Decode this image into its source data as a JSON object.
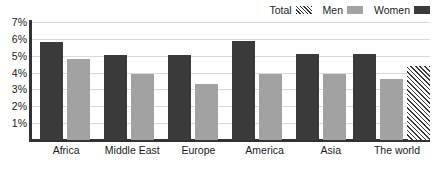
{
  "chart_data": {
    "type": "bar",
    "title": "",
    "subtitle": "",
    "xlabel": "",
    "ylabel": "",
    "ylim": [
      0,
      7
    ],
    "y_ticks": [
      "1%",
      "2%",
      "3%",
      "4%",
      "5%",
      "6%",
      "7%"
    ],
    "y_tick_values": [
      1,
      2,
      3,
      4,
      5,
      6,
      7
    ],
    "grid": true,
    "legend_position": "top-right",
    "categories": [
      "Africa",
      "Middle East",
      "Europe",
      "America",
      "Asia",
      "The world"
    ],
    "series": [
      {
        "name": "Women",
        "color": "#3a3a3a",
        "pattern": "solid",
        "values": [
          5.8,
          5.05,
          5.05,
          5.85,
          5.1,
          5.1
        ]
      },
      {
        "name": "Men",
        "color": "#a2a2a2",
        "pattern": "solid",
        "values": [
          4.8,
          3.9,
          3.3,
          3.9,
          3.9,
          3.6
        ]
      },
      {
        "name": "Total",
        "color": "#3a3a3a",
        "pattern": "diagonal-hatch",
        "values": [
          null,
          null,
          null,
          null,
          null,
          4.4
        ]
      }
    ]
  },
  "legend": {
    "entries": [
      {
        "label": "Total",
        "swatch": "total-swatch"
      },
      {
        "label": "Men",
        "swatch": "men-swatch"
      },
      {
        "label": "Women",
        "swatch": "women-swatch"
      }
    ]
  },
  "colors": {
    "women": "#3a3a3a",
    "men": "#a2a2a2",
    "axis": "#333333",
    "gridline": "#d9d9d9",
    "background": "#ffffff",
    "text": "#1a1a1a"
  }
}
